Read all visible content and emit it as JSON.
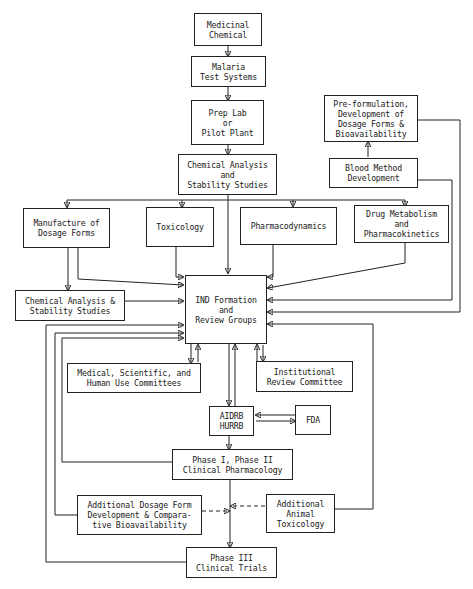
{
  "diagram": {
    "nodes": {
      "medicinal_chemical": [
        "Medicinal",
        "Chemical"
      ],
      "malaria_test": [
        "Malaria",
        "Test Systems"
      ],
      "prep_lab": [
        "Prep Lab",
        "or",
        "Pilot Plant"
      ],
      "chem_analysis_1": [
        "Chemical Analysis",
        "and",
        "Stability Studies"
      ],
      "preformulation": [
        "Pre-formulation,",
        "Development of",
        "Dosage Forms &",
        "Bioavailability"
      ],
      "blood_method": [
        "Blood Method",
        "Development"
      ],
      "manufacture": [
        "Manufacture of",
        "Dosage Forms"
      ],
      "toxicology": [
        "Toxicology"
      ],
      "pharmacodynamics": [
        "Pharmacodynamics"
      ],
      "drug_metabolism": [
        "Drug Metabolism",
        "and",
        "Pharmacokinetics"
      ],
      "chem_analysis_2": [
        "Chemical Analysis &",
        "Stability Studies"
      ],
      "ind": [
        "IND Formation",
        "and",
        "Review Groups"
      ],
      "medical_committees": [
        "Medical, Scientific, and",
        "Human Use Committees"
      ],
      "irc": [
        "Institutional",
        "Review Committee"
      ],
      "aidrb": [
        "AIDRB",
        "HURRB"
      ],
      "fda": [
        "FDA"
      ],
      "phase12": [
        "Phase I, Phase II",
        "Clinical Pharmacology"
      ],
      "add_dosage": [
        "Additional Dosage Form",
        "Development & Compara-",
        "tive Bioavailability"
      ],
      "add_animal": [
        "Additional",
        "Animal",
        "Toxicology"
      ],
      "phase3": [
        "Phase III",
        "Clinical Trials"
      ]
    }
  }
}
